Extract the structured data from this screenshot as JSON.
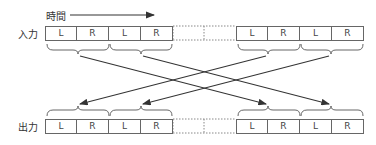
{
  "labels": {
    "time": "時間",
    "input": "入力",
    "output": "出力"
  },
  "cells": {
    "c0": "L",
    "c1": "R",
    "c2": "L",
    "c3": "R",
    "c4": "L",
    "c5": "R",
    "c6": "L",
    "c7": "R"
  },
  "colors": {
    "line": "#333333",
    "border": "#666666",
    "dotted": "#888888"
  }
}
